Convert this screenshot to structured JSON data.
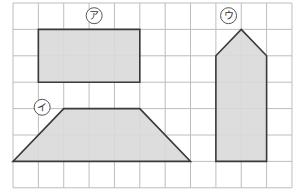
{
  "grid": {
    "origin_x": 13,
    "origin_y": 3,
    "cell_w": 25.36,
    "cell_h": 26.4,
    "cols": 11,
    "rows": 7,
    "line_color": "#bdbdbd"
  },
  "style": {
    "fill": "#d9d9d9",
    "stroke": "#3a3a3a",
    "label_stroke": "#555555"
  },
  "shapes": [
    {
      "id": "a",
      "label": "ア",
      "type": "rectangle",
      "points": [
        [
          1,
          1
        ],
        [
          5,
          1
        ],
        [
          5,
          3
        ],
        [
          1,
          3
        ]
      ],
      "label_pos": [
        3.2,
        0.48
      ]
    },
    {
      "id": "i",
      "label": "イ",
      "type": "trapezoid",
      "points": [
        [
          2,
          4
        ],
        [
          5,
          4
        ],
        [
          7,
          6
        ],
        [
          0,
          6
        ]
      ],
      "label_pos": [
        1.15,
        3.95
      ]
    },
    {
      "id": "u",
      "label": "ウ",
      "type": "pentagon",
      "points": [
        [
          9,
          1
        ],
        [
          10,
          2
        ],
        [
          10,
          6
        ],
        [
          8,
          6
        ],
        [
          8,
          2
        ]
      ],
      "label_pos": [
        8.5,
        0.48
      ]
    }
  ]
}
